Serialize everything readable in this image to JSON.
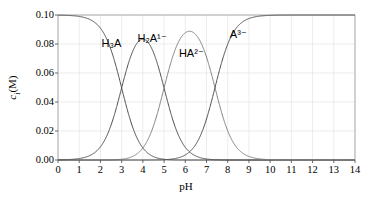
{
  "chart_data": {
    "type": "line",
    "title": "",
    "xlabel": "pH",
    "ylabel": "c_i (M)",
    "xlim": [
      0,
      14
    ],
    "ylim": [
      0.0,
      0.1
    ],
    "grid": true,
    "legend": "inline-annotations",
    "total_concentration_M": 0.1,
    "pKa": [
      3.0,
      5.0,
      7.4
    ],
    "xticks": [
      "0",
      "1",
      "2",
      "3",
      "4",
      "5",
      "6",
      "7",
      "8",
      "9",
      "10",
      "11",
      "12",
      "13",
      "14"
    ],
    "xtick_values": [
      0,
      1,
      2,
      3,
      4,
      5,
      6,
      7,
      8,
      9,
      10,
      11,
      12,
      13,
      14
    ],
    "yticks": [
      "0.00",
      "0.02",
      "0.04",
      "0.06",
      "0.08",
      "0.10"
    ],
    "ytick_values": [
      0.0,
      0.02,
      0.04,
      0.06,
      0.08,
      0.1
    ],
    "x": [
      0,
      0.5,
      1,
      1.5,
      2,
      2.5,
      3,
      3.5,
      4,
      4.5,
      5,
      5.5,
      6,
      6.5,
      7,
      7.5,
      8,
      8.5,
      9,
      9.5,
      10,
      10.5,
      11,
      11.5,
      12,
      12.5,
      13,
      13.5,
      14
    ],
    "series": [
      {
        "name": "H3A",
        "label": "H₃A",
        "color": "#4d4d4d",
        "annotation_pH": 2.05,
        "annotation_c": 0.084,
        "values": [
          0.1,
          0.0997,
          0.099,
          0.0969,
          0.0909,
          0.076,
          0.05,
          0.0241,
          0.0087,
          0.0028,
          0.0009,
          0.0003,
          0.0001,
          0.0,
          0.0,
          0.0,
          0.0,
          0.0,
          0.0,
          0.0,
          0.0,
          0.0,
          0.0,
          0.0,
          0.0,
          0.0,
          0.0,
          0.0,
          0.0
        ]
      },
      {
        "name": "H2A1-",
        "label": "H₂A¹⁻",
        "color": "#4d4d4d",
        "annotation_pH": 3.75,
        "annotation_c": 0.0875,
        "values": [
          0.0003,
          0.001,
          0.0031,
          0.0097,
          0.0287,
          0.0712,
          0.0497,
          0.0758,
          0.0762,
          0.0693,
          0.0468,
          0.0201,
          0.0068,
          0.0022,
          0.0007,
          0.0002,
          0.0001,
          0.0,
          0.0,
          0.0,
          0.0,
          0.0,
          0.0,
          0.0,
          0.0,
          0.0,
          0.0,
          0.0,
          0.0
        ]
      },
      {
        "name": "HA2-",
        "label": "HA²⁻",
        "color": "#808080",
        "annotation_pH": 5.7,
        "annotation_c": 0.0775,
        "values": [
          0.0,
          0.0,
          0.0,
          0.0,
          0.0,
          0.0002,
          0.0005,
          0.0024,
          0.0076,
          0.0219,
          0.0468,
          0.0634,
          0.0674,
          0.0685,
          0.0652,
          0.05,
          0.0248,
          0.0093,
          0.0031,
          0.001,
          0.0003,
          0.0001,
          0.0,
          0.0,
          0.0,
          0.0,
          0.0,
          0.0,
          0.0
        ]
      },
      {
        "name": "A3-",
        "label": "A³⁻",
        "color": "#4d4d4d",
        "annotation_pH": 8.1,
        "annotation_c": 0.0905,
        "values": [
          0.0,
          0.0,
          0.0,
          0.0,
          0.0,
          0.0,
          0.0,
          0.0,
          0.0,
          0.0001,
          0.0002,
          0.0008,
          0.0027,
          0.0086,
          0.026,
          0.05,
          0.0751,
          0.0907,
          0.0969,
          0.099,
          0.0997,
          0.0999,
          0.1,
          0.1,
          0.1,
          0.1,
          0.1,
          0.1,
          0.1
        ]
      }
    ]
  },
  "axes": {
    "x_title": "pH",
    "y_title_var": "c",
    "y_title_sub": "i",
    "y_title_unit": "(M)"
  }
}
